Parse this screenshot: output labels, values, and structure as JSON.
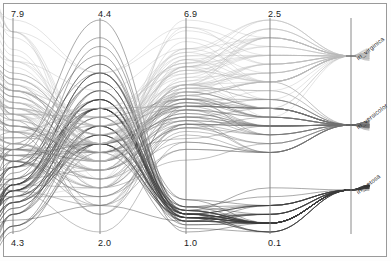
{
  "chart_data": {
    "type": "line",
    "plot_style": "parallel-coordinates-curved",
    "title": "",
    "xlabel": "",
    "ylabel": "",
    "grid": false,
    "legend_position": "right-axis-labels",
    "axes": [
      {
        "name": "sepal length",
        "max_label": "7.9",
        "min_label": "4.3",
        "x": 13,
        "max": 7.9,
        "min": 4.3
      },
      {
        "name": "sepal width",
        "max_label": "4.4",
        "min_label": "2.0",
        "x": 100,
        "max": 4.4,
        "min": 2.0
      },
      {
        "name": "petal length",
        "max_label": "6.9",
        "min_label": "1.0",
        "x": 186,
        "max": 6.9,
        "min": 1.0
      },
      {
        "name": "petal width",
        "max_label": "2.5",
        "min_label": "0.1",
        "x": 270,
        "max": 2.5,
        "min": 0.1
      },
      {
        "name": "class",
        "max_label": "",
        "min_label": "",
        "x": 351,
        "max": 0,
        "min": 0
      }
    ],
    "class_axis": {
      "x": 351,
      "levels": [
        {
          "label": "iri_virginica",
          "y": 56,
          "color": "#b9b9b9"
        },
        {
          "label": "iri_versicolor",
          "y": 125,
          "color": "#6f6f6f"
        },
        {
          "label": "iri_setosa",
          "y": 190,
          "color": "#3a3a3a"
        }
      ]
    },
    "classes": [
      "iri_setosa",
      "iri_versicolor",
      "iri_virginica"
    ],
    "series": [
      {
        "name": "iri_setosa",
        "color": "#3a3a3a",
        "count": 50,
        "values": [
          [
            5.1,
            3.5,
            1.4,
            0.2
          ],
          [
            4.9,
            3.0,
            1.4,
            0.2
          ],
          [
            4.7,
            3.2,
            1.3,
            0.2
          ],
          [
            4.6,
            3.1,
            1.5,
            0.2
          ],
          [
            5.0,
            3.6,
            1.4,
            0.2
          ],
          [
            5.4,
            3.9,
            1.7,
            0.4
          ],
          [
            4.6,
            3.4,
            1.4,
            0.3
          ],
          [
            5.0,
            3.4,
            1.5,
            0.2
          ],
          [
            4.4,
            2.9,
            1.4,
            0.2
          ],
          [
            4.9,
            3.1,
            1.5,
            0.1
          ],
          [
            5.4,
            3.7,
            1.5,
            0.2
          ],
          [
            4.8,
            3.4,
            1.6,
            0.2
          ],
          [
            4.8,
            3.0,
            1.4,
            0.1
          ],
          [
            4.3,
            3.0,
            1.1,
            0.1
          ],
          [
            5.8,
            4.0,
            1.2,
            0.2
          ],
          [
            5.7,
            4.4,
            1.5,
            0.4
          ],
          [
            5.4,
            3.9,
            1.3,
            0.4
          ],
          [
            5.1,
            3.5,
            1.4,
            0.3
          ],
          [
            5.7,
            3.8,
            1.7,
            0.3
          ],
          [
            5.1,
            3.8,
            1.5,
            0.3
          ],
          [
            5.4,
            3.4,
            1.7,
            0.2
          ],
          [
            5.1,
            3.7,
            1.5,
            0.4
          ],
          [
            4.6,
            3.6,
            1.0,
            0.2
          ],
          [
            5.1,
            3.3,
            1.7,
            0.5
          ],
          [
            4.8,
            3.4,
            1.9,
            0.2
          ],
          [
            5.0,
            3.0,
            1.6,
            0.2
          ],
          [
            5.0,
            3.4,
            1.6,
            0.4
          ],
          [
            5.2,
            3.5,
            1.5,
            0.2
          ],
          [
            5.2,
            3.4,
            1.4,
            0.2
          ],
          [
            4.7,
            3.2,
            1.6,
            0.2
          ],
          [
            4.8,
            3.1,
            1.6,
            0.2
          ],
          [
            5.4,
            3.4,
            1.5,
            0.4
          ],
          [
            5.2,
            4.1,
            1.5,
            0.1
          ],
          [
            5.5,
            4.2,
            1.4,
            0.2
          ],
          [
            4.9,
            3.1,
            1.5,
            0.2
          ],
          [
            5.0,
            3.2,
            1.2,
            0.2
          ],
          [
            5.5,
            3.5,
            1.3,
            0.2
          ],
          [
            4.9,
            3.6,
            1.4,
            0.1
          ],
          [
            4.4,
            3.0,
            1.3,
            0.2
          ],
          [
            5.1,
            3.4,
            1.5,
            0.2
          ],
          [
            5.0,
            3.5,
            1.3,
            0.3
          ],
          [
            4.5,
            2.3,
            1.3,
            0.3
          ],
          [
            4.4,
            3.2,
            1.3,
            0.2
          ],
          [
            5.0,
            3.5,
            1.6,
            0.6
          ],
          [
            5.1,
            3.8,
            1.9,
            0.4
          ],
          [
            4.8,
            3.0,
            1.4,
            0.3
          ],
          [
            5.1,
            3.8,
            1.6,
            0.2
          ],
          [
            4.6,
            3.2,
            1.4,
            0.2
          ],
          [
            5.3,
            3.7,
            1.5,
            0.2
          ],
          [
            5.0,
            3.3,
            1.4,
            0.2
          ]
        ]
      },
      {
        "name": "iri_versicolor",
        "color": "#6f6f6f",
        "count": 50,
        "values": [
          [
            7.0,
            3.2,
            4.7,
            1.4
          ],
          [
            6.4,
            3.2,
            4.5,
            1.5
          ],
          [
            6.9,
            3.1,
            4.9,
            1.5
          ],
          [
            5.5,
            2.3,
            4.0,
            1.3
          ],
          [
            6.5,
            2.8,
            4.6,
            1.5
          ],
          [
            5.7,
            2.8,
            4.5,
            1.3
          ],
          [
            6.3,
            3.3,
            4.7,
            1.6
          ],
          [
            4.9,
            2.4,
            3.3,
            1.0
          ],
          [
            6.6,
            2.9,
            4.6,
            1.3
          ],
          [
            5.2,
            2.7,
            3.9,
            1.4
          ],
          [
            5.0,
            2.0,
            3.5,
            1.0
          ],
          [
            5.9,
            3.0,
            4.2,
            1.5
          ],
          [
            6.0,
            2.2,
            4.0,
            1.0
          ],
          [
            6.1,
            2.9,
            4.7,
            1.4
          ],
          [
            5.6,
            2.9,
            3.6,
            1.3
          ],
          [
            6.7,
            3.1,
            4.4,
            1.4
          ],
          [
            5.6,
            3.0,
            4.5,
            1.5
          ],
          [
            5.8,
            2.7,
            4.1,
            1.0
          ],
          [
            6.2,
            2.2,
            4.5,
            1.5
          ],
          [
            5.6,
            2.5,
            3.9,
            1.1
          ],
          [
            5.9,
            3.2,
            4.8,
            1.8
          ],
          [
            6.1,
            2.8,
            4.0,
            1.3
          ],
          [
            6.3,
            2.5,
            4.9,
            1.5
          ],
          [
            6.1,
            2.8,
            4.7,
            1.2
          ],
          [
            6.4,
            2.9,
            4.3,
            1.3
          ],
          [
            6.6,
            3.0,
            4.4,
            1.4
          ],
          [
            6.8,
            2.8,
            4.8,
            1.4
          ],
          [
            6.7,
            3.0,
            5.0,
            1.7
          ],
          [
            6.0,
            2.9,
            4.5,
            1.5
          ],
          [
            5.7,
            2.6,
            3.5,
            1.0
          ],
          [
            5.5,
            2.4,
            3.8,
            1.1
          ],
          [
            5.5,
            2.4,
            3.7,
            1.0
          ],
          [
            5.8,
            2.7,
            3.9,
            1.2
          ],
          [
            6.0,
            2.7,
            5.1,
            1.6
          ],
          [
            5.4,
            3.0,
            4.5,
            1.5
          ],
          [
            6.0,
            3.4,
            4.5,
            1.6
          ],
          [
            6.7,
            3.1,
            4.7,
            1.5
          ],
          [
            6.3,
            2.3,
            4.4,
            1.3
          ],
          [
            5.6,
            3.0,
            4.1,
            1.3
          ],
          [
            5.5,
            2.5,
            4.0,
            1.3
          ],
          [
            5.5,
            2.6,
            4.4,
            1.2
          ],
          [
            6.1,
            3.0,
            4.6,
            1.4
          ],
          [
            5.8,
            2.6,
            4.0,
            1.2
          ],
          [
            5.0,
            2.3,
            3.3,
            1.0
          ],
          [
            5.6,
            2.7,
            4.2,
            1.3
          ],
          [
            5.7,
            3.0,
            4.2,
            1.2
          ],
          [
            5.7,
            2.9,
            4.2,
            1.3
          ],
          [
            6.2,
            2.9,
            4.3,
            1.3
          ],
          [
            5.1,
            2.5,
            3.0,
            1.1
          ],
          [
            5.7,
            2.8,
            4.1,
            1.3
          ]
        ]
      },
      {
        "name": "iri_virginica",
        "color": "#b9b9b9",
        "count": 50,
        "values": [
          [
            6.3,
            3.3,
            6.0,
            2.5
          ],
          [
            5.8,
            2.7,
            5.1,
            1.9
          ],
          [
            7.1,
            3.0,
            5.9,
            2.1
          ],
          [
            6.3,
            2.9,
            5.6,
            1.8
          ],
          [
            6.5,
            3.0,
            5.8,
            2.2
          ],
          [
            7.6,
            3.0,
            6.6,
            2.1
          ],
          [
            4.9,
            2.5,
            4.5,
            1.7
          ],
          [
            7.3,
            2.9,
            6.3,
            1.8
          ],
          [
            6.7,
            2.5,
            5.8,
            1.8
          ],
          [
            7.2,
            3.6,
            6.1,
            2.5
          ],
          [
            6.5,
            3.2,
            5.1,
            2.0
          ],
          [
            6.4,
            2.7,
            5.3,
            1.9
          ],
          [
            6.8,
            3.0,
            5.5,
            2.1
          ],
          [
            5.7,
            2.5,
            5.0,
            2.0
          ],
          [
            5.8,
            2.8,
            5.1,
            2.4
          ],
          [
            6.4,
            3.2,
            5.3,
            2.3
          ],
          [
            6.5,
            3.0,
            5.5,
            1.8
          ],
          [
            7.7,
            3.8,
            6.7,
            2.2
          ],
          [
            7.7,
            2.6,
            6.9,
            2.3
          ],
          [
            6.0,
            2.2,
            5.0,
            1.5
          ],
          [
            6.9,
            3.2,
            5.7,
            2.3
          ],
          [
            5.6,
            2.8,
            4.9,
            2.0
          ],
          [
            7.7,
            2.8,
            6.7,
            2.0
          ],
          [
            6.3,
            2.7,
            4.9,
            1.8
          ],
          [
            6.7,
            3.3,
            5.7,
            2.1
          ],
          [
            7.2,
            3.2,
            6.0,
            1.8
          ],
          [
            6.2,
            2.8,
            4.8,
            1.8
          ],
          [
            6.1,
            3.0,
            4.9,
            1.8
          ],
          [
            6.4,
            2.8,
            5.6,
            2.1
          ],
          [
            7.2,
            3.0,
            5.8,
            1.6
          ],
          [
            7.4,
            2.8,
            6.1,
            1.9
          ],
          [
            7.9,
            3.8,
            6.4,
            2.0
          ],
          [
            6.4,
            2.8,
            5.6,
            2.2
          ],
          [
            6.3,
            2.8,
            5.1,
            1.5
          ],
          [
            6.1,
            2.6,
            5.6,
            1.4
          ],
          [
            7.7,
            3.0,
            6.1,
            2.3
          ],
          [
            6.3,
            3.4,
            5.6,
            2.4
          ],
          [
            6.4,
            3.1,
            5.5,
            1.8
          ],
          [
            6.0,
            3.0,
            4.8,
            1.8
          ],
          [
            6.9,
            3.1,
            5.4,
            2.1
          ],
          [
            6.7,
            3.1,
            5.6,
            2.4
          ],
          [
            6.9,
            3.1,
            5.1,
            2.3
          ],
          [
            5.8,
            2.7,
            5.1,
            1.9
          ],
          [
            6.8,
            3.2,
            5.9,
            2.3
          ],
          [
            6.7,
            3.3,
            5.7,
            2.5
          ],
          [
            6.7,
            3.0,
            5.2,
            2.3
          ],
          [
            6.3,
            2.5,
            5.0,
            1.9
          ],
          [
            6.5,
            3.0,
            5.2,
            2.0
          ],
          [
            6.2,
            3.4,
            5.4,
            2.3
          ],
          [
            5.9,
            3.0,
            5.1,
            1.8
          ]
        ]
      }
    ]
  },
  "plot_geometry": {
    "top_y": 20,
    "bottom_y": 232,
    "label_top_y": 9,
    "label_bottom_y": 238
  }
}
